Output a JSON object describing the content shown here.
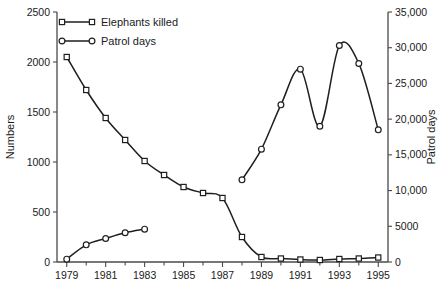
{
  "chart_data": {
    "type": "line",
    "title": "",
    "xlabel": "",
    "ylabel": "Numbers",
    "y2label": "Patrol days",
    "grid": false,
    "legend_position": "top-left-inside",
    "xlim": [
      1978.5,
      1995.5
    ],
    "ylim": [
      0,
      2500
    ],
    "y2lim": [
      0,
      35000
    ],
    "x": [
      1979,
      1980,
      1981,
      1982,
      1983,
      1984,
      1985,
      1986,
      1987,
      1988,
      1989,
      1990,
      1991,
      1992,
      1993,
      1994,
      1995
    ],
    "xticks_major": [
      1979,
      1981,
      1983,
      1985,
      1987,
      1989,
      1991,
      1993,
      1995
    ],
    "xtick_labels": [
      "1979",
      "1981",
      "1983",
      "1985",
      "1987",
      "1989",
      "1991",
      "1993",
      "1995"
    ],
    "yticks": [
      0,
      500,
      1000,
      1500,
      2000,
      2500
    ],
    "ytick_labels": [
      "0",
      "500",
      "1000",
      "1500",
      "2000",
      "2500"
    ],
    "y2ticks": [
      0,
      5000,
      10000,
      15000,
      20000,
      25000,
      30000,
      35000
    ],
    "y2tick_labels": [
      "0",
      "5000",
      "10,000",
      "15,000",
      "20,000",
      "25,000",
      "30,000",
      "35,000"
    ],
    "series": [
      {
        "name": "Elephants killed",
        "axis": "left",
        "marker": "square",
        "x": [
          1979,
          1980,
          1981,
          1982,
          1983,
          1984,
          1985,
          1986,
          1987,
          1988,
          1989,
          1990,
          1991,
          1992,
          1993,
          1994,
          1995
        ],
        "values": [
          2050,
          1720,
          1440,
          1220,
          1010,
          870,
          750,
          690,
          640,
          250,
          50,
          35,
          25,
          20,
          30,
          35,
          45
        ]
      },
      {
        "name": "Patrol days",
        "axis": "right",
        "marker": "circle",
        "segments": [
          {
            "x": [
              1979,
              1980,
              1981,
              1982,
              1983
            ],
            "values": [
              400,
              2400,
              3300,
              4100,
              4600
            ]
          },
          {
            "x": [
              1988,
              1989,
              1990,
              1991,
              1992,
              1993,
              1994,
              1995
            ],
            "values": [
              11500,
              15800,
              22000,
              27000,
              19000,
              30300,
              27800,
              18500
            ]
          }
        ]
      }
    ]
  },
  "legend": {
    "items": [
      {
        "label": "Elephants killed",
        "marker": "square"
      },
      {
        "label": "Patrol days",
        "marker": "circle"
      }
    ]
  },
  "axes": {
    "left_title": "Numbers",
    "right_title": "Patrol days"
  }
}
